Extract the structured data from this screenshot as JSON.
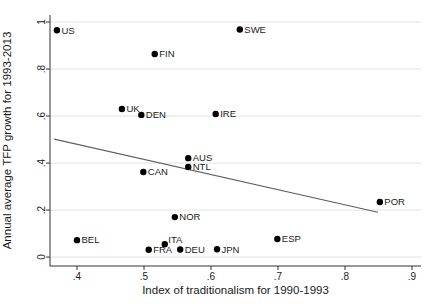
{
  "chart_data": {
    "type": "scatter",
    "title": "",
    "xlabel": "Index of traditionalism for 1990-1993",
    "ylabel": "Annual average TFP growth for 1993-2013",
    "xlim": [
      0.3597,
      0.9134
    ],
    "ylim": [
      -0.038,
      1.03
    ],
    "grid": "horizontal-only",
    "legend": "none",
    "x_ticks": [
      {
        "v": 0.4,
        "label": ".4"
      },
      {
        "v": 0.5,
        "label": ".5"
      },
      {
        "v": 0.6,
        "label": ".6"
      },
      {
        "v": 0.7,
        "label": ".7"
      },
      {
        "v": 0.8,
        "label": ".8"
      },
      {
        "v": 0.9,
        "label": ".9"
      }
    ],
    "y_ticks": [
      {
        "v": 0.0,
        "label": "0"
      },
      {
        "v": 0.2,
        "label": ".2"
      },
      {
        "v": 0.4,
        "label": ".4"
      },
      {
        "v": 0.6,
        "label": ".6"
      },
      {
        "v": 0.8,
        "label": ".8"
      },
      {
        "v": 1.0,
        "label": "1"
      }
    ],
    "points": [
      {
        "label": "US",
        "x": 0.37,
        "y": 0.965
      },
      {
        "label": "SWE",
        "x": 0.643,
        "y": 0.968
      },
      {
        "label": "FIN",
        "x": 0.516,
        "y": 0.864
      },
      {
        "label": "UK",
        "x": 0.467,
        "y": 0.63
      },
      {
        "label": "DEN",
        "x": 0.496,
        "y": 0.605
      },
      {
        "label": "IRE",
        "x": 0.607,
        "y": 0.609
      },
      {
        "label": "AUS",
        "x": 0.566,
        "y": 0.421
      },
      {
        "label": "NTL",
        "x": 0.566,
        "y": 0.383
      },
      {
        "label": "CAN",
        "x": 0.499,
        "y": 0.362
      },
      {
        "label": "NOR",
        "x": 0.546,
        "y": 0.17
      },
      {
        "label": "BEL",
        "x": 0.4,
        "y": 0.072
      },
      {
        "label": "FRA",
        "x": 0.507,
        "y": 0.031
      },
      {
        "label": "ITA",
        "x": 0.531,
        "y": 0.055,
        "label_dx": -1,
        "label_dy": -4
      },
      {
        "label": "DEU",
        "x": 0.554,
        "y": 0.032
      },
      {
        "label": "JPN",
        "x": 0.609,
        "y": 0.033
      },
      {
        "label": "ESP",
        "x": 0.699,
        "y": 0.077
      },
      {
        "label": "POR",
        "x": 0.852,
        "y": 0.234
      }
    ],
    "trend_line": {
      "x1": 0.366,
      "y1": 0.502,
      "x2": 0.849,
      "y2": 0.191
    }
  },
  "colors": {
    "background": "#ffffff",
    "point": "#000000",
    "point_label": "#1a1a1a",
    "trend": "#606060",
    "grid": "#e2e2e2",
    "axis": "#333333",
    "tick_text": "#1a1a1a",
    "axis_title_text": "#1a1a1a"
  }
}
